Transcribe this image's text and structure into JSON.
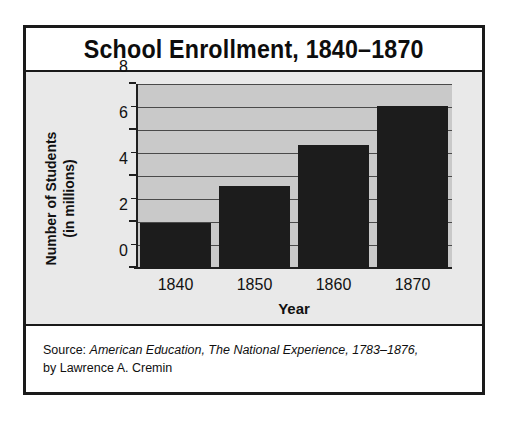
{
  "chart_data": {
    "type": "bar",
    "title": "School Enrollment, 1840–1870",
    "xlabel": "Year",
    "ylabel": "Number of Students\n(in millions)",
    "ylabel_line1": "Number of Students",
    "ylabel_line2": "(in millions)",
    "categories": [
      "1840",
      "1850",
      "1860",
      "1870"
    ],
    "values": [
      2.0,
      3.6,
      5.4,
      7.1
    ],
    "ylim": [
      0,
      8
    ],
    "ytick_labels": [
      "0",
      "2",
      "4",
      "6",
      "8"
    ],
    "ytick_values": [
      0,
      2,
      4,
      6,
      8
    ],
    "minor_tick_values": [
      1,
      3,
      5,
      7
    ],
    "gridline_values": [
      1,
      2,
      3,
      4,
      5,
      6,
      7,
      8
    ],
    "grid": true,
    "legend": "none",
    "bar_color": "#1c1c1c",
    "plot_background": "#c9c9c9",
    "panel_background": "#e9e9e9",
    "frame_color": "#1a1a1a"
  },
  "source": {
    "prefix": "Source: ",
    "book_title": "American Education, The National Experience, 1783–1876,",
    "author_line": "by Lawrence A. Cremin"
  }
}
